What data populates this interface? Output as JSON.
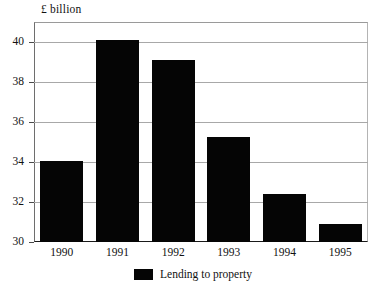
{
  "chart_data": {
    "type": "bar",
    "title": "",
    "subtitle": "",
    "ylabel": "£ billion",
    "xlabel": "",
    "categories": [
      "1990",
      "1991",
      "1992",
      "1993",
      "1994",
      "1995"
    ],
    "values": [
      34.05,
      40.1,
      39.1,
      35.25,
      32.4,
      30.9
    ],
    "series": [
      {
        "name": "Lending to property",
        "values": [
          34.05,
          40.1,
          39.1,
          35.25,
          32.4,
          30.9
        ],
        "color": "#050505"
      }
    ],
    "ylim": [
      30,
      41
    ],
    "yticks": [
      30,
      32,
      34,
      36,
      38,
      40
    ],
    "ytick_labels": [
      "30",
      "32",
      "34",
      "36",
      "38",
      "40"
    ],
    "grid": true,
    "grid_axis": "y",
    "legend": {
      "position": "bottom-center",
      "entries": [
        {
          "label": "Lending to property",
          "color": "#050505"
        }
      ]
    },
    "bar_color": "#050505",
    "background_color": "#ffffff",
    "axis_color": "#1a1a1a",
    "gridline_color": "#a8a8a8"
  },
  "axis": {
    "y_title": "£ billion"
  },
  "legend": {
    "marker_name": "black-square-marker",
    "label": "Lending to property"
  }
}
